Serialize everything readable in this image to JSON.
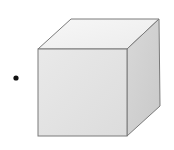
{
  "figure": {
    "colors": {
      "background": "#ffffff",
      "front_face": "#e4e4e4",
      "top_face": "#f2f2f2",
      "side_face": "#d2d2d2",
      "edge": "#7a7a7a",
      "dot": "#111111"
    },
    "cube": {
      "front": {
        "x1": 38,
        "y1": 49,
        "x2": 127,
        "y2": 136
      },
      "back_offset": {
        "dx": 33,
        "dy": -30
      }
    },
    "dot": {
      "cx": 16,
      "cy": 78,
      "r": 2.6
    }
  }
}
